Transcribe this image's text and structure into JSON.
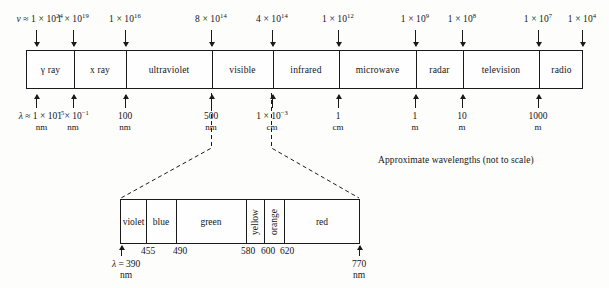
{
  "diagram": {
    "caption": "Approximate wavelengths (not to scale)",
    "frequency_axis": {
      "symbol": "ν ≈",
      "labels": [
        {
          "mantissa": "1 × 10",
          "exp": "24",
          "x": 36,
          "with_symbol": true
        },
        {
          "mantissa": "1 × 10",
          "exp": "19",
          "x": 73,
          "with_symbol": false
        },
        {
          "mantissa": "1 × 10",
          "exp": "16",
          "x": 125,
          "with_symbol": false
        },
        {
          "mantissa": "8 × 10",
          "exp": "14",
          "x": 211,
          "with_symbol": false
        },
        {
          "mantissa": "4 × 10",
          "exp": "14",
          "x": 272,
          "with_symbol": false
        },
        {
          "mantissa": "1 × 10",
          "exp": "12",
          "x": 338,
          "with_symbol": false
        },
        {
          "mantissa": "1 × 10",
          "exp": "9",
          "x": 415,
          "with_symbol": false
        },
        {
          "mantissa": "1 × 10",
          "exp": "8",
          "x": 462,
          "with_symbol": false
        },
        {
          "mantissa": "1 × 10",
          "exp": "7",
          "x": 538,
          "with_symbol": false
        },
        {
          "mantissa": "1 × 10",
          "exp": "4",
          "x": 582,
          "with_symbol": false
        }
      ]
    },
    "bands": [
      {
        "label": "γ ray",
        "start": 26,
        "end": 73
      },
      {
        "label": "x ray",
        "start": 73,
        "end": 125
      },
      {
        "label": "ultraviolet",
        "start": 125,
        "end": 211
      },
      {
        "label": "visible",
        "start": 211,
        "end": 272
      },
      {
        "label": "infrared",
        "start": 272,
        "end": 338
      },
      {
        "label": "microwave",
        "start": 338,
        "end": 415
      },
      {
        "label": "radar",
        "start": 415,
        "end": 462
      },
      {
        "label": "television",
        "start": 462,
        "end": 538
      },
      {
        "label": "radio",
        "start": 538,
        "end": 583
      }
    ],
    "wavelength_axis": {
      "symbol": "λ ≈",
      "labels": [
        {
          "value": "1 × 10",
          "exp": "−5",
          "unit": "nm",
          "x": 36,
          "with_symbol": true
        },
        {
          "value": "1 × 10",
          "exp": "−1",
          "unit": "nm",
          "x": 73,
          "with_symbol": false
        },
        {
          "value": "100",
          "exp": "",
          "unit": "nm",
          "x": 125,
          "with_symbol": false
        },
        {
          "value": "500",
          "exp": "",
          "unit": "nm",
          "x": 211,
          "with_symbol": false
        },
        {
          "value": "1 × 10",
          "exp": "−3",
          "unit": "cm",
          "x": 272,
          "with_symbol": false
        },
        {
          "value": "1",
          "exp": "",
          "unit": "cm",
          "x": 338,
          "with_symbol": false
        },
        {
          "value": "1",
          "exp": "",
          "unit": "m",
          "x": 415,
          "with_symbol": false
        },
        {
          "value": "10",
          "exp": "",
          "unit": "m",
          "x": 462,
          "with_symbol": false
        },
        {
          "value": "1000",
          "exp": "",
          "unit": "m",
          "x": 538,
          "with_symbol": false
        }
      ]
    },
    "visible_detail": {
      "colors": [
        {
          "label": "violet",
          "start": 120,
          "end": 145,
          "rotated": false
        },
        {
          "label": "blue",
          "start": 145,
          "end": 175,
          "rotated": false
        },
        {
          "label": "green",
          "start": 175,
          "end": 245,
          "rotated": false
        },
        {
          "label": "yellow",
          "start": 245,
          "end": 263,
          "rotated": true
        },
        {
          "label": "orange",
          "start": 263,
          "end": 283,
          "rotated": true
        },
        {
          "label": "red",
          "start": 283,
          "end": 359,
          "rotated": false
        }
      ],
      "ticks": [
        {
          "value": "455",
          "x": 148
        },
        {
          "value": "490",
          "x": 180
        },
        {
          "value": "580",
          "x": 248
        },
        {
          "value": "600",
          "x": 268
        },
        {
          "value": "620",
          "x": 287
        }
      ],
      "left_end": {
        "symbol": "λ =",
        "value": "390",
        "unit": "nm",
        "x": 121
      },
      "right_end": {
        "symbol": "",
        "value": "770",
        "unit": "nm",
        "x": 359
      }
    }
  }
}
